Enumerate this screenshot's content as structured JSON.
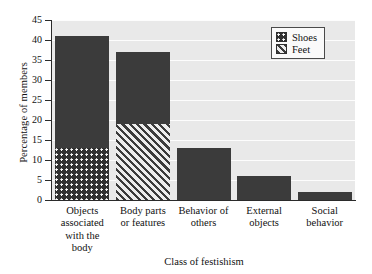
{
  "chart_data": {
    "type": "bar",
    "title": "",
    "xlabel": "Class of festishism",
    "ylabel": "Percentage of members",
    "ylim": [
      0,
      45
    ],
    "yticks": [
      0,
      5,
      10,
      15,
      20,
      25,
      30,
      35,
      40,
      45
    ],
    "grid": true,
    "stacked": true,
    "legend_position": "top-right",
    "categories": [
      "Objects associated with the body",
      "Body parts or features",
      "Behavior of others",
      "External objects",
      "Social behavior"
    ],
    "category_lines": [
      [
        "Objects",
        "associated",
        "with the",
        "body"
      ],
      [
        "Body parts",
        "or features"
      ],
      [
        "Behavior of",
        "others"
      ],
      [
        "External",
        "objects"
      ],
      [
        "Social",
        "behavior"
      ]
    ],
    "totals": [
      41,
      37,
      13,
      6,
      2
    ],
    "series": [
      {
        "name": "Shoes",
        "pattern": "dots",
        "color": "#303030",
        "values": [
          13,
          0,
          0,
          0,
          0
        ]
      },
      {
        "name": "Feet",
        "pattern": "hatch",
        "color": "#3b3b3b",
        "values": [
          0,
          19,
          0,
          0,
          0
        ]
      },
      {
        "name": "Other",
        "pattern": "solid",
        "color": "#3b3b3b",
        "values": [
          28,
          18,
          13,
          6,
          2
        ]
      }
    ]
  },
  "legend": {
    "items": [
      {
        "label": "Shoes",
        "pattern": "dots"
      },
      {
        "label": "Feet",
        "pattern": "hatch"
      }
    ]
  },
  "axes": {
    "y_tick_labels": [
      "0",
      "5",
      "10",
      "15",
      "20",
      "25",
      "30",
      "35",
      "40",
      "45"
    ],
    "y_title": "Percentage of members",
    "x_title": "Class of festishism"
  },
  "colors": {
    "plot_background": "#e9e9e9",
    "gridline": "#fdfdfd",
    "bar_dark": "#3b3b3b",
    "axis": "#2b2b2b",
    "text": "#111111"
  }
}
